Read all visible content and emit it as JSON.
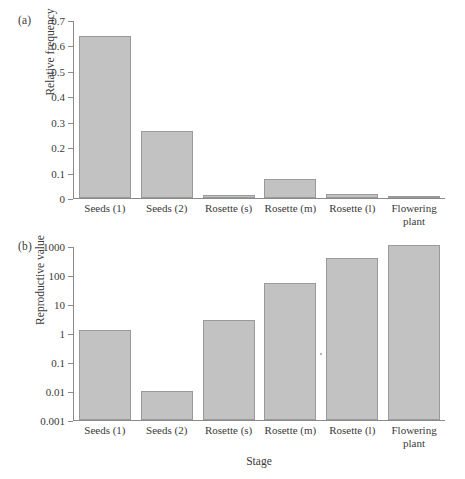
{
  "figure": {
    "xlabel": "Stage",
    "categories": [
      "Seeds (1)",
      "Seeds (2)",
      "Rosette (s)",
      "Rosette (m)",
      "Rosette (l)",
      "Flowering plant"
    ],
    "bar_fill": "#c2c2c2",
    "bar_stroke": "#9a9a9a",
    "axis_color": "#8a8a8a"
  },
  "panel_a": {
    "tag": "(a)",
    "ylabel": "Relative frequency",
    "yticks": [
      "0",
      "0.1",
      "0.2",
      "0.3",
      "0.4",
      "0.5",
      "0.6",
      "0.7"
    ]
  },
  "panel_b": {
    "tag": "(b)",
    "ylabel": "Reproductive value",
    "yticks": [
      "0.001",
      "0.01",
      "0.1",
      "1",
      "10",
      "100",
      "1000"
    ]
  },
  "chart_data": [
    {
      "type": "bar",
      "panel": "(a)",
      "title": "",
      "xlabel": "Stage",
      "ylabel": "Relative frequency",
      "scale": "linear",
      "ylim": [
        0,
        0.7
      ],
      "ytick_values": [
        0,
        0.1,
        0.2,
        0.3,
        0.4,
        0.5,
        0.6,
        0.7
      ],
      "ytick_labels": [
        "0",
        "0.1",
        "0.2",
        "0.3",
        "0.4",
        "0.5",
        "0.6",
        "0.7"
      ],
      "grid": false,
      "legend": "none",
      "categories": [
        "Seeds (1)",
        "Seeds (2)",
        "Rosette (s)",
        "Rosette (m)",
        "Rosette (l)",
        "Flowering plant"
      ],
      "values": [
        0.64,
        0.265,
        0.012,
        0.075,
        0.014,
        0.005
      ]
    },
    {
      "type": "bar",
      "panel": "(b)",
      "title": "",
      "xlabel": "Stage",
      "ylabel": "Reproductive value",
      "scale": "log",
      "ylim": [
        0.001,
        1000
      ],
      "ytick_values": [
        0.001,
        0.01,
        0.1,
        1,
        10,
        100,
        1000
      ],
      "ytick_labels": [
        "0.001",
        "0.01",
        "0.1",
        "1",
        "10",
        "100",
        "1000"
      ],
      "grid": false,
      "legend": "none",
      "categories": [
        "Seeds (1)",
        "Seeds (2)",
        "Rosette (s)",
        "Rosette (m)",
        "Rosette (l)",
        "Flowering plant"
      ],
      "values": [
        1.3,
        0.0105,
        3.0,
        55,
        400,
        1150
      ]
    }
  ]
}
